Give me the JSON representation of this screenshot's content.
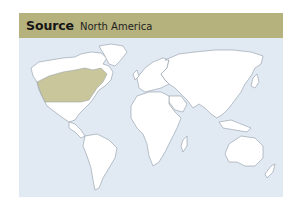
{
  "header": {
    "title": "Source",
    "subtitle": "North America"
  },
  "map": {
    "highlighted_region": "North America (eastern USA / southern Canada)",
    "colors": {
      "header_bg": "#b5b27e",
      "ocean": "#e1e9f3",
      "land": "#ffffff",
      "highlight": "#c8c69a",
      "outline": "#8f9aa6"
    }
  }
}
